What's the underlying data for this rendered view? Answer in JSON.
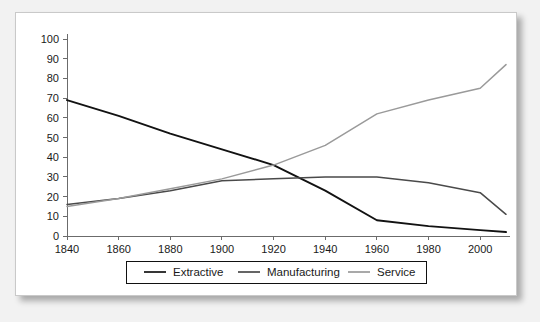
{
  "chart_data": {
    "type": "line",
    "title": "",
    "xlabel": "",
    "ylabel": "",
    "xlim": [
      1840,
      2010
    ],
    "ylim": [
      0,
      100
    ],
    "grid": false,
    "legend_position": "bottom",
    "xticks": [
      "1840",
      "1860",
      "1880",
      "1900",
      "1920",
      "1940",
      "1960",
      "1980",
      "2000"
    ],
    "yticks": [
      "0",
      "10",
      "20",
      "30",
      "40",
      "50",
      "60",
      "70",
      "80",
      "90",
      "100"
    ],
    "x": [
      1840,
      1860,
      1880,
      1900,
      1920,
      1940,
      1960,
      1980,
      2000,
      2010
    ],
    "series": [
      {
        "name": "Extractive",
        "color": "#121212",
        "values": [
          69,
          61,
          52,
          44,
          36,
          23,
          8,
          5,
          3,
          2
        ]
      },
      {
        "name": "Manufacturing",
        "color": "#4a4a4a",
        "values": [
          16,
          19,
          23,
          28,
          29,
          30,
          30,
          27,
          22,
          11
        ]
      },
      {
        "name": "Service",
        "color": "#9a9a9a",
        "values": [
          15,
          19,
          24,
          29,
          36,
          46,
          62,
          69,
          75,
          87
        ]
      }
    ]
  },
  "legend": {
    "items": [
      {
        "label": "Extractive"
      },
      {
        "label": "Manufacturing"
      },
      {
        "label": "Service"
      }
    ]
  },
  "colors": {
    "card_background": "#ffffff",
    "page_background": "#f2f2f2",
    "axis": "#6b6b6b",
    "text": "#1a1a1a"
  }
}
